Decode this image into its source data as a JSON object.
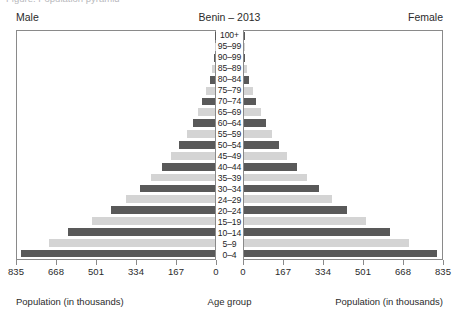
{
  "top_sliver": {
    "text": "Figure: Population pyramid"
  },
  "header": {
    "male_label": "Male",
    "title": "Benin – 2013",
    "female_label": "Female"
  },
  "captions": {
    "left": "Population (in thousands)",
    "center": "Age group",
    "right": "Population (in thousands)"
  },
  "colors": {
    "bar_dark": "#595959",
    "bar_light": "#d4d4d4",
    "frame": "#8a8a8a",
    "text": "#2b2b2b"
  },
  "chart_data": {
    "type": "bar",
    "subtype": "population-pyramid",
    "title": "Benin – 2013",
    "xlabel": "Population (in thousands)",
    "ylabel": "Age group",
    "xlim": [
      0,
      835
    ],
    "xticks": [
      0,
      167,
      334,
      501,
      668,
      835
    ],
    "xtick_labels_left": [
      "835",
      "668",
      "501",
      "334",
      "167",
      "0"
    ],
    "xtick_labels_right": [
      "0",
      "167",
      "334",
      "501",
      "668",
      "835"
    ],
    "grid": false,
    "legend": false,
    "categories": [
      "0–4",
      "5–9",
      "10–14",
      "15–19",
      "20–24",
      "24–29",
      "30–34",
      "35–39",
      "40–44",
      "45–49",
      "50–54",
      "55–59",
      "60–64",
      "65–69",
      "70–74",
      "75–79",
      "80–84",
      "85–89",
      "90–99",
      "95–99",
      "100+"
    ],
    "series": [
      {
        "name": "Male",
        "side": "left",
        "values": [
          820,
          700,
          620,
          520,
          440,
          375,
          318,
          268,
          224,
          184,
          150,
          120,
          94,
          72,
          53,
          36,
          22,
          12,
          6,
          2,
          1
        ]
      },
      {
        "name": "Female",
        "side": "right",
        "values": [
          815,
          695,
          615,
          515,
          436,
          372,
          316,
          266,
          222,
          182,
          149,
          119,
          93,
          71,
          52,
          36,
          22,
          12,
          6,
          2,
          1
        ]
      }
    ],
    "bar_color_cycle": [
      "#595959",
      "#d4d4d4"
    ]
  }
}
